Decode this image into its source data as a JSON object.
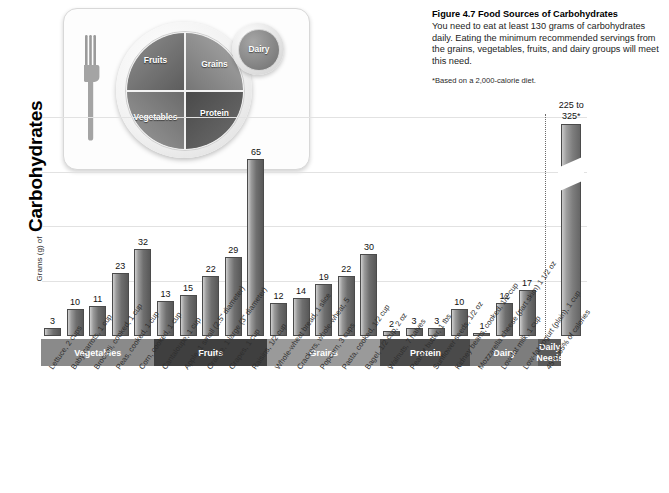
{
  "caption": {
    "figure_number": "Figure 4.7",
    "title": "Food Sources of Carbohydrates",
    "body": "You need to eat at least 130 grams of carbohydrates daily. Eating the minimum recommended servings from the grains, vegetables, fruits, and dairy groups will meet this need.",
    "note": "*Based on a 2,000-calorie diet."
  },
  "plate": {
    "fruits": "Fruits",
    "grains": "Grains",
    "vegetables": "Vegetables",
    "protein": "Protein",
    "dairy": "Dairy"
  },
  "axis": {
    "y_prefix": "Grams (g) of",
    "y_main": "Carbohydrates"
  },
  "chart_data": {
    "type": "bar",
    "title": "Food Sources of Carbohydrates",
    "xlabel": "",
    "ylabel": "Grams (g) of Carbohydrates",
    "ylim": [
      0,
      80
    ],
    "gridlines": [
      20,
      40,
      60,
      80
    ],
    "grid": true,
    "legend": "none",
    "categories": [
      "Lettuce, 2 cups",
      "Baby carrots, 1 cup",
      "Broccoli, cooked, 1 cup",
      "Peas, cooked, 1 cup",
      "Corn, cooked, 1 cup",
      "Cantaloupe, 1 cup",
      "Apple, 1 small (2.5\" diameter)",
      "Orange, 1 large (3\" diameter)",
      "Grapes, 1 cup",
      "Raisins, 1/2 cup",
      "Whole-wheat bread, 1 slice",
      "Crackers, whole-wheat, 5",
      "Popcorn, 3 cups",
      "Pasta, cooked, 1/2 cup",
      "Bagel, 1/2 cup, 2 oz",
      "Walnuts, 7 halves",
      "Peanut butter, 1 tbs",
      "Sunflower seeds, 1/2 oz",
      "Kidney beans, cooked, 1/2 cup",
      "Mozzarella cheese (part skim) 1 1/2 oz",
      "Low-fat milk, 1 cup",
      "Low-fat yogurt (plain), 1 cup",
      "45 to 65% of calories"
    ],
    "values": [
      3,
      10,
      11,
      23,
      32,
      13,
      15,
      22,
      29,
      65,
      12,
      14,
      19,
      22,
      30,
      2,
      3,
      3,
      10,
      1,
      12,
      17,
      325
    ],
    "value_labels": [
      "3",
      "10",
      "11",
      "23",
      "32",
      "13",
      "15",
      "22",
      "29",
      "65",
      "12",
      "14",
      "19",
      "22",
      "30",
      "2",
      "3",
      "3",
      "10",
      "1",
      "12",
      "17",
      "225 to 325*"
    ],
    "broken_bar_index": 22,
    "groups": [
      {
        "label": "Vegetables",
        "start": 0,
        "end": 4,
        "color": "#8a8a8a"
      },
      {
        "label": "Fruits",
        "start": 5,
        "end": 9,
        "color": "#3f3f3f"
      },
      {
        "label": "Grains",
        "start": 10,
        "end": 14,
        "color": "#9a9a9a"
      },
      {
        "label": "Protein",
        "start": 15,
        "end": 18,
        "color": "#4a4a4a"
      },
      {
        "label": "Dairy",
        "start": 19,
        "end": 21,
        "color": "#7d7d7d"
      },
      {
        "label": "Daily Needs",
        "start": 22,
        "end": 22,
        "color": "#5a5a5a",
        "two_line": true
      }
    ]
  }
}
